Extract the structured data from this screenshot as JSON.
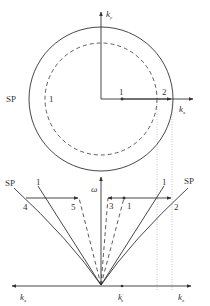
{
  "top_panel": {
    "axes": {
      "x_label": "k",
      "x_sub": "x",
      "y_label": "k",
      "y_sub": "y"
    },
    "outer_circle_label": "SP",
    "dashed_circle_label": "1",
    "point_labels": [
      "1",
      "2"
    ]
  },
  "bottom_panel": {
    "axes": {
      "y_label": "ω",
      "x_left_label": "k",
      "x_left_sub": "x",
      "x_right_label": "k",
      "x_right_sub": "x",
      "x_mid_label": "k",
      "x_mid_sub": "x",
      "x_mid_prime": "′"
    },
    "line_labels": {
      "sp_left": "SP",
      "one_left": "1",
      "one_right": "1",
      "sp_right": "SP"
    },
    "point_labels": [
      "4",
      "5",
      "3",
      "1",
      "2"
    ]
  },
  "colors": {
    "stroke": "#333333",
    "background": "#ffffff"
  }
}
